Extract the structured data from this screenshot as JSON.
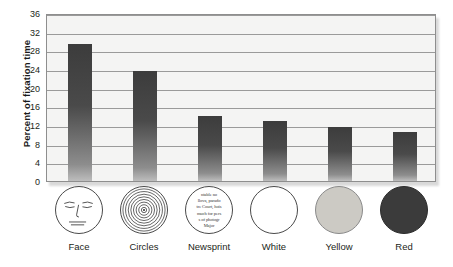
{
  "chart_data": {
    "type": "bar",
    "title": "",
    "xlabel": "",
    "ylabel": "Percent of fixation time",
    "categories": [
      "Face",
      "Circles",
      "Newsprint",
      "White",
      "Yellow",
      "Red"
    ],
    "values": [
      29.5,
      23.8,
      14.2,
      13.1,
      11.7,
      10.8
    ],
    "ylim": [
      0,
      36
    ],
    "yticks": [
      0,
      4,
      8,
      12,
      16,
      20,
      24,
      28,
      32,
      36
    ],
    "ytick_labels": [
      "0",
      "4",
      "8",
      "12",
      "16",
      "20",
      "24",
      "28",
      "32",
      "36"
    ],
    "grid": true,
    "legend": "none",
    "bar_color": "#454545",
    "plot_background": "#f4f4f3",
    "gridline_color": "#9a9a9a"
  },
  "axis": {
    "y_title": "Percent of fixation time"
  },
  "swatches": [
    {
      "name": "Face",
      "icon": "face-icon",
      "style": "outline"
    },
    {
      "name": "Circles",
      "icon": "concentric-circles-icon",
      "style": "outline"
    },
    {
      "name": "Newsprint",
      "icon": "newsprint-icon",
      "style": "outline"
    },
    {
      "name": "White",
      "icon": "white-circle-icon",
      "style": "outline",
      "color": "#ffffff"
    },
    {
      "name": "Yellow",
      "icon": "yellow-circle-icon",
      "style": "yellow",
      "color": "#cccac4"
    },
    {
      "name": "Red",
      "icon": "red-circle-icon",
      "style": "red",
      "color": "#3b3b3b"
    }
  ],
  "newsprint_lines": [
    "ntable no",
    "llova, parado",
    "tre Court, hois",
    "much for pers",
    "s of photogr",
    "Major"
  ]
}
